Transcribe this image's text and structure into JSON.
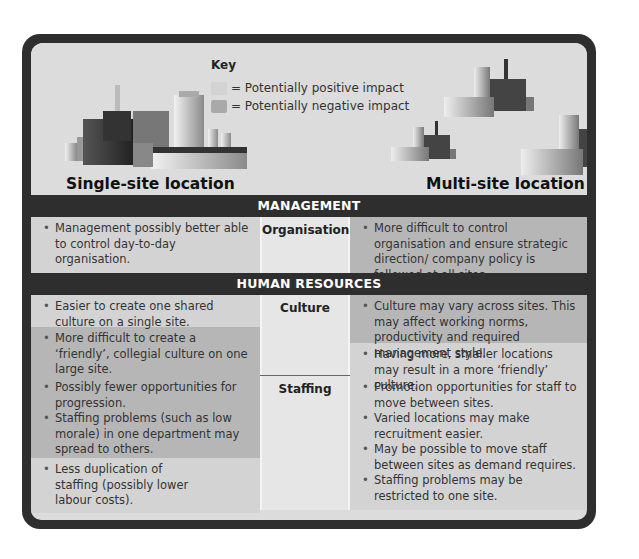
{
  "key": {
    "title": "Key",
    "positive_label": "= Potentially positive impact",
    "negative_label": "= Potentially negative impact",
    "positive_color": "#d3d3d3",
    "negative_color": "#b6b6b6"
  },
  "columns": {
    "single": "Single-site location",
    "multi": "Multi-site location"
  },
  "sections": [
    {
      "header": "MANAGEMENT",
      "rows": [
        {
          "category": "Organisation",
          "single": [
            {
              "text": "Management possibly better able to control day-to-day organisation.",
              "impact": "positive"
            }
          ],
          "multi": [
            {
              "text": "More difficult to control organisation and ensure strategic direction/ company policy is followed at all sites.",
              "impact": "negative"
            }
          ]
        }
      ]
    },
    {
      "header": "HUMAN RESOURCES",
      "rows": [
        {
          "category": "Culture",
          "single": [
            {
              "text": "Easier to create one shared culture on a single site.",
              "impact": "positive"
            },
            {
              "text": "More difficult to create a ‘friendly’, collegial culture on one large site.",
              "impact": "negative"
            }
          ],
          "multi": [
            {
              "text": "Culture may vary across sites. This may affect working norms, productivity and required management style.",
              "impact": "negative"
            },
            {
              "text": "Having more, smaller locations may result in a more ‘friendly’ culture.",
              "impact": "positive"
            }
          ]
        },
        {
          "category": "Staffing",
          "single": [
            {
              "text": "Possibly fewer opportunities for progression.",
              "impact": "negative"
            },
            {
              "text": "Staffing problems (such as low morale) in one department may spread to others.",
              "impact": "negative"
            },
            {
              "text": "Less duplication of staffing (possibly lower labour costs).",
              "impact": "positive"
            }
          ],
          "multi": [
            {
              "text": "Promotion opportunities for staff to move between sites.",
              "impact": "positive"
            },
            {
              "text": "Varied locations may make recruitment easier.",
              "impact": "positive"
            },
            {
              "text": "May be possible to move staff between sites as demand requires.",
              "impact": "positive"
            },
            {
              "text": "Staffing problems may be restricted to one site.",
              "impact": "positive"
            }
          ]
        }
      ]
    }
  ]
}
